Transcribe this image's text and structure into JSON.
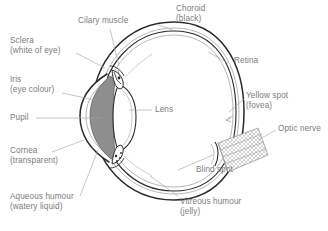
{
  "diagram": {
    "style": "pencil-sketch anatomical diagram",
    "background_color": "#ffffff",
    "text_color": "#7b7b7b",
    "line_color": "#9a9a9a",
    "outline_color": "#2b2b2b",
    "fill_gray": "#8e8e8e",
    "fill_white": "#ffffff"
  },
  "labels": {
    "ciliary_muscle": {
      "line1": "Cilary muscle",
      "line2": ""
    },
    "choroid": {
      "line1": "Choroid",
      "line2": "(black)"
    },
    "sclera": {
      "line1": "Sclera",
      "line2": "(white of eye)"
    },
    "retina": {
      "line1": "Retina",
      "line2": ""
    },
    "iris": {
      "line1": "Iris",
      "line2": "(eye colour)"
    },
    "lens": {
      "line1": "Lens",
      "line2": ""
    },
    "yellow_spot": {
      "line1": "Yellow spot",
      "line2": "(fovea)"
    },
    "pupil": {
      "line1": "Pupil",
      "line2": ""
    },
    "optic_nerve": {
      "line1": "Optic nerve",
      "line2": ""
    },
    "cornea": {
      "line1": "Cornea",
      "line2": "(transparent)"
    },
    "blind_spot": {
      "line1": "Blind spot",
      "line2": ""
    },
    "aqueous_humour": {
      "line1": "Aqueous humour",
      "line2": "(watery liquid)"
    },
    "vitreous_humour": {
      "line1": "Vitreous humour",
      "line2": "(jelly)"
    }
  }
}
